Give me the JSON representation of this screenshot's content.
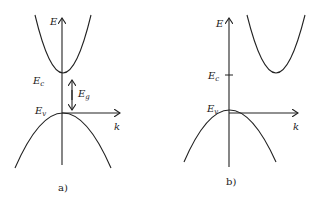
{
  "panels": [
    {
      "id": "a",
      "caption": "a)",
      "labels": {
        "energy_axis": "E",
        "k_axis": "k",
        "conduction_edge": "E",
        "conduction_edge_sub": "c",
        "valence_edge": "E",
        "valence_edge_sub": "v",
        "gap": "E",
        "gap_sub": "g"
      },
      "band_type": "direct"
    },
    {
      "id": "b",
      "caption": "b)",
      "labels": {
        "energy_axis": "E",
        "k_axis": "k",
        "conduction_edge": "E",
        "conduction_edge_sub": "c",
        "valence_edge": "E",
        "valence_edge_sub": "v"
      },
      "band_type": "indirect"
    }
  ]
}
